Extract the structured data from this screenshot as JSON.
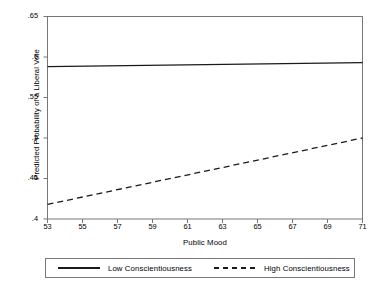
{
  "chart_data": {
    "type": "line",
    "title": "",
    "xlabel": "Public Mood",
    "ylabel": "Predicted Probability of a Liberal Vote",
    "xlim": [
      53,
      71
    ],
    "ylim": [
      0.4,
      0.65
    ],
    "grid": false,
    "legend_position": "bottom",
    "xticks": [
      53,
      55,
      57,
      59,
      61,
      63,
      65,
      67,
      69,
      71
    ],
    "xtick_labels": [
      "53",
      "55",
      "57",
      "59",
      "61",
      "63",
      "65",
      "67",
      "69",
      "71"
    ],
    "yticks": [
      0.4,
      0.45,
      0.5,
      0.55,
      0.6,
      0.65
    ],
    "ytick_labels": [
      ".4",
      ".45",
      ".5",
      ".55",
      ".6",
      ".65"
    ],
    "x": [
      53,
      71
    ],
    "series": [
      {
        "name": "Low Conscientiousness",
        "style": "solid",
        "color": "#1a1a1a",
        "values": [
          0.588,
          0.593
        ]
      },
      {
        "name": "High Conscientiousness",
        "style": "dashed",
        "color": "#1a1a1a",
        "values": [
          0.418,
          0.5
        ]
      }
    ]
  },
  "axes": {
    "x_title": "Public Mood",
    "y_title": "Predicted Probability of a Liberal Vote"
  },
  "legend": {
    "entries": [
      {
        "label": "Low Conscientiousness",
        "style": "solid"
      },
      {
        "label": "High Conscientiousness",
        "style": "dashed"
      }
    ]
  },
  "ticks": {
    "y": [
      ".65",
      ".6",
      ".55",
      ".5",
      ".45",
      ".4"
    ],
    "x": [
      "53",
      "55",
      "57",
      "59",
      "61",
      "63",
      "65",
      "67",
      "69",
      "71"
    ]
  }
}
